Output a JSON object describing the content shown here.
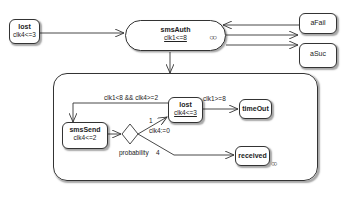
{
  "colors": {
    "stroke": "#333333",
    "background": "#ffffff",
    "text": "#222222"
  },
  "states": {
    "lost_top": {
      "name": "lost",
      "invariant": "clk4<=3"
    },
    "smsAuth": {
      "name": "smsAuth",
      "invariant": "clk1<=8",
      "icon": "composite-state-icon"
    },
    "aFail": {
      "name": "aFail"
    },
    "aSuc": {
      "name": "aSuc"
    },
    "smsSend": {
      "name": "smsSend",
      "invariant": "clk4<=2"
    },
    "lost_inner": {
      "name": "lost",
      "invariant": "clk4<=3"
    },
    "timeOut": {
      "name": "timeOut"
    },
    "received": {
      "name": "received",
      "icon": "composite-state-icon"
    }
  },
  "transitions": {
    "retry_guard": "clk1<8 && clk4>=2",
    "timeout_guard": "clk1>=8",
    "lost_weight": "1",
    "lost_reset": "clk4:=0",
    "received_weight": "4",
    "choice_label": "probability"
  }
}
